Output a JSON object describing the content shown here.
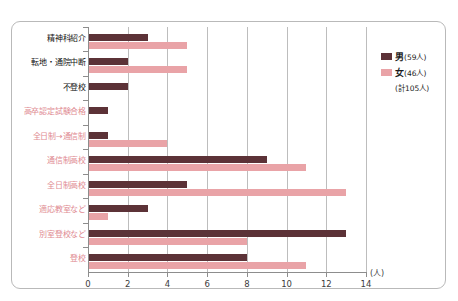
{
  "chart_data": {
    "type": "bar",
    "orientation": "horizontal",
    "title": "",
    "xlabel": "(人)",
    "ylabel": "",
    "xlim": [
      0,
      14
    ],
    "xticks": [
      0,
      2,
      4,
      6,
      8,
      10,
      12,
      14
    ],
    "grid": true,
    "legend_position": "right",
    "categories": [
      "精神科紹介",
      "転地・通院中断",
      "不登校",
      "高卒認定試験合格",
      "全日制→通信制",
      "通信制高校",
      "全日制高校",
      "適応教室など",
      "別室登校など",
      "登校"
    ],
    "category_colors": [
      "dark",
      "dark",
      "dark",
      "pink",
      "pink",
      "pink",
      "pink",
      "pink",
      "pink",
      "pink"
    ],
    "series": [
      {
        "name": "男",
        "count_label": "(59人)",
        "color": "#5c3237",
        "values": [
          3,
          2,
          2,
          1,
          1,
          9,
          5,
          3,
          13,
          8
        ]
      },
      {
        "name": "女",
        "count_label": "(46人)",
        "color": "#e9a3a7",
        "values": [
          5,
          5,
          0,
          0,
          4,
          11,
          13,
          1,
          8,
          11
        ]
      }
    ],
    "total_label": "(計105人)"
  },
  "legend": {
    "male_key": "男",
    "male_count": "(59人)",
    "female_key": "女",
    "female_count": "(46人)",
    "total": "(計105人)"
  },
  "axis": {
    "unit": "(人)",
    "ticks": [
      "0",
      "2",
      "4",
      "6",
      "8",
      "10",
      "12",
      "14"
    ]
  }
}
